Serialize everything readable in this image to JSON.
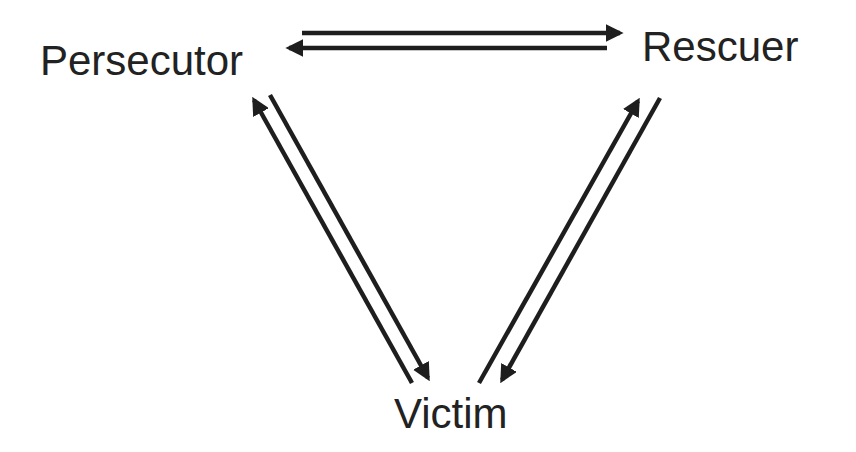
{
  "diagram": {
    "type": "drama-triangle",
    "nodes": {
      "persecutor": {
        "label": "Persecutor"
      },
      "rescuer": {
        "label": "Rescuer"
      },
      "victim": {
        "label": "Victim"
      }
    },
    "edges": [
      {
        "from": "persecutor",
        "to": "rescuer"
      },
      {
        "from": "rescuer",
        "to": "persecutor"
      },
      {
        "from": "persecutor",
        "to": "victim"
      },
      {
        "from": "victim",
        "to": "persecutor"
      },
      {
        "from": "rescuer",
        "to": "victim"
      },
      {
        "from": "victim",
        "to": "rescuer"
      }
    ],
    "colors": {
      "text": "#222222",
      "arrow": "#1e1e1e",
      "background": "#ffffff"
    }
  }
}
